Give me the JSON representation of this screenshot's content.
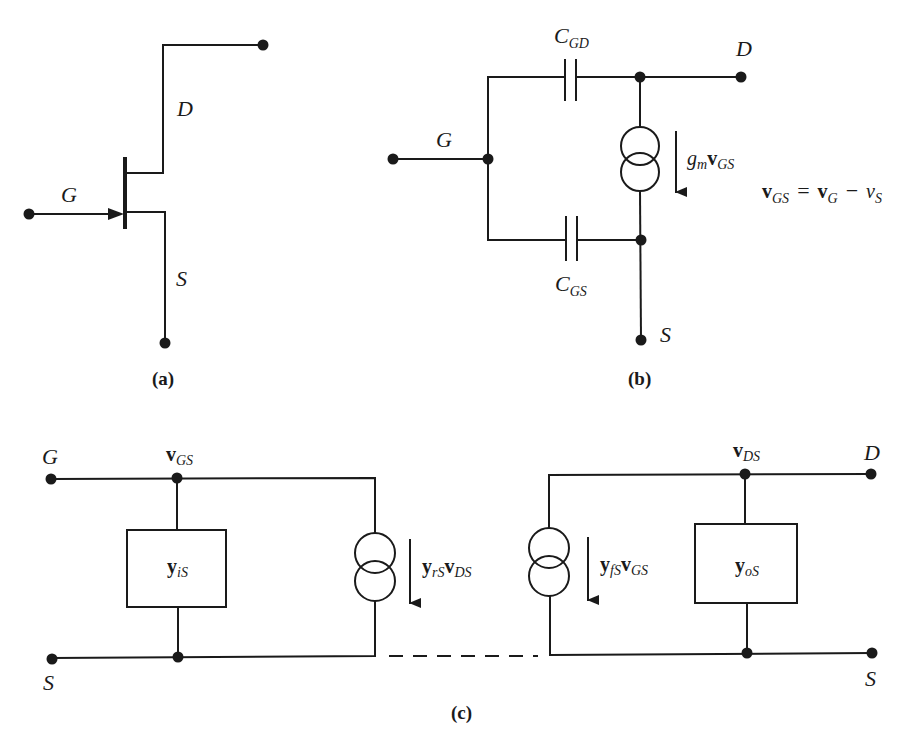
{
  "figure": {
    "parts": [
      {
        "id": "a",
        "caption": "(a)",
        "description": "JFET (n-channel) symbol",
        "terminals": {
          "gate": "G",
          "drain": "D",
          "source": "S"
        }
      },
      {
        "id": "b",
        "caption": "(b)",
        "description": "Small-signal equivalent with capacitances",
        "terminals": {
          "gate": "G",
          "drain": "D",
          "source": "S"
        },
        "components": {
          "cgd": {
            "main": "C",
            "sub": "GD"
          },
          "cgs": {
            "main": "C",
            "sub": "GS"
          },
          "current_source": {
            "main": "g",
            "sub1": "m",
            "main2": "v",
            "sub2": "GS"
          }
        },
        "equation": {
          "lhs_main": "v",
          "lhs_sub": "GS",
          "eq": "=",
          "t1_main": "v",
          "t1_sub": "G",
          "minus": "−",
          "t2_main": "v",
          "t2_sub": "S"
        }
      },
      {
        "id": "c",
        "caption": "(c)",
        "description": "Two-port y-parameter model",
        "terminals": {
          "gate": "G",
          "source_left": "S",
          "drain": "D",
          "source_right": "S"
        },
        "node_labels": {
          "vgs": {
            "main": "v",
            "sub": "GS"
          },
          "vds": {
            "main": "v",
            "sub": "DS"
          }
        },
        "components": {
          "yis": {
            "main": "y",
            "sub": "iS"
          },
          "yos": {
            "main": "y",
            "sub": "oS"
          },
          "reverse_source": {
            "m1": "y",
            "s1": "rS",
            "m2": "v",
            "s2": "DS"
          },
          "forward_source": {
            "m1": "y",
            "s1": "fS",
            "m2": "v",
            "s2": "GS"
          }
        }
      }
    ]
  }
}
